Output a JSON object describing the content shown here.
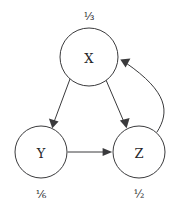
{
  "diagram": {
    "type": "directed-graph",
    "background_color": "#ffffff",
    "stroke_color": "#3a3a3c",
    "text_color": "#26262a",
    "nodes": [
      {
        "id": "X",
        "label": "X",
        "weight_label": "⅓",
        "weight_value": "1/3",
        "weight_position": "above",
        "cx": 89,
        "cy": 57,
        "r": 29
      },
      {
        "id": "Y",
        "label": "Y",
        "weight_label": "⅙",
        "weight_value": "1/6",
        "weight_position": "below",
        "cx": 41,
        "cy": 152,
        "r": 26
      },
      {
        "id": "Z",
        "label": "Z",
        "weight_label": "½",
        "weight_value": "1/2",
        "weight_position": "below",
        "cx": 139,
        "cy": 152,
        "r": 26
      }
    ],
    "edges": [
      {
        "id": "x-to-y",
        "from": "X",
        "to": "Y",
        "shape": "straight"
      },
      {
        "id": "x-to-z",
        "from": "X",
        "to": "Z",
        "shape": "straight"
      },
      {
        "id": "y-to-z",
        "from": "Y",
        "to": "Z",
        "shape": "straight"
      },
      {
        "id": "z-to-x",
        "from": "Z",
        "to": "X",
        "shape": "curved-right"
      }
    ]
  }
}
